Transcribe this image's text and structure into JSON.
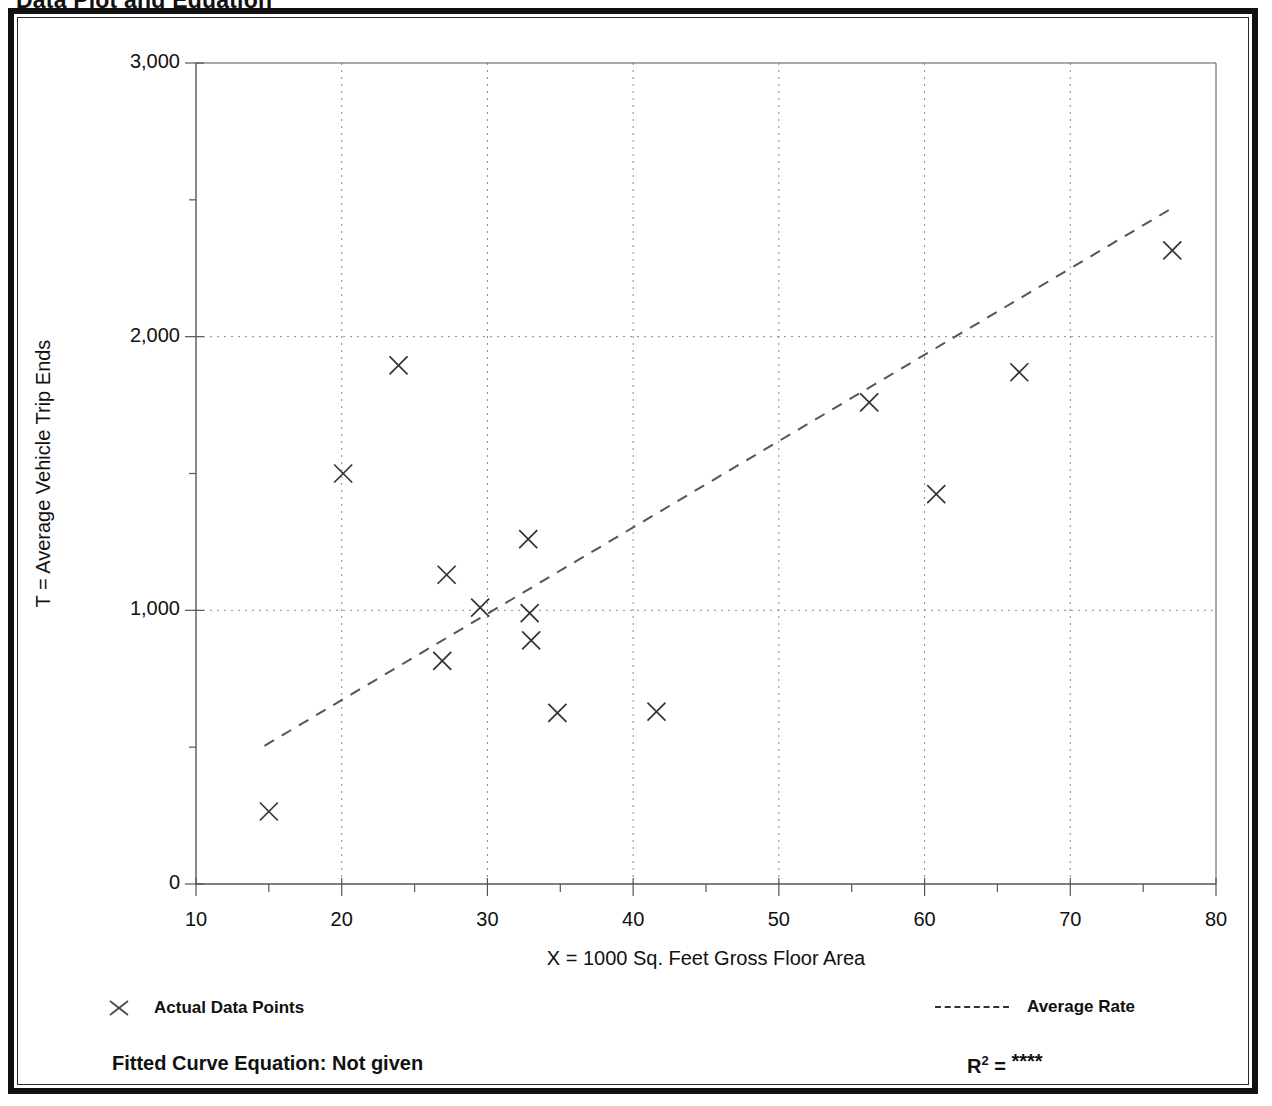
{
  "page": {
    "title": "Data Plot and Equation"
  },
  "chart_data": {
    "type": "scatter",
    "title": "Data Plot and Equation",
    "xlabel": "X = 1000 Sq. Feet Gross Floor Area",
    "ylabel": "T = Average Vehicle Trip Ends",
    "xlim": [
      10,
      80
    ],
    "ylim": [
      0,
      3000
    ],
    "xticks": [
      "10",
      "20",
      "30",
      "40",
      "50",
      "60",
      "70",
      "80"
    ],
    "xtick_values": [
      10,
      20,
      30,
      40,
      50,
      60,
      70,
      80
    ],
    "yticks": [
      "0",
      "1,000",
      "2,000",
      "3,000"
    ],
    "ytick_values": [
      0,
      1000,
      2000,
      3000
    ],
    "xminor_step": 5,
    "yminor_step": 500,
    "grid": "dotted at major ticks",
    "legend_position": "below plot, left and right",
    "series": [
      {
        "name": "Actual Data Points",
        "type": "scatter",
        "marker": "x",
        "points": [
          {
            "x": 15.0,
            "y": 265
          },
          {
            "x": 20.1,
            "y": 1500
          },
          {
            "x": 23.9,
            "y": 1895
          },
          {
            "x": 26.9,
            "y": 815
          },
          {
            "x": 27.2,
            "y": 1130
          },
          {
            "x": 29.5,
            "y": 1010
          },
          {
            "x": 32.8,
            "y": 1260
          },
          {
            "x": 32.9,
            "y": 990
          },
          {
            "x": 33.0,
            "y": 890
          },
          {
            "x": 34.8,
            "y": 625
          },
          {
            "x": 41.6,
            "y": 630
          },
          {
            "x": 56.2,
            "y": 1760
          },
          {
            "x": 60.8,
            "y": 1425
          },
          {
            "x": 66.5,
            "y": 1870
          },
          {
            "x": 77.0,
            "y": 2315
          }
        ]
      },
      {
        "name": "Average Rate",
        "type": "line",
        "style": "dashed",
        "endpoints": [
          {
            "x": 14.7,
            "y": 505
          },
          {
            "x": 77.0,
            "y": 2470
          }
        ]
      }
    ]
  },
  "legend": {
    "actual_data_points": "Actual Data Points",
    "average_rate": "Average Rate",
    "marker_icon": "x-marker-icon",
    "line_icon": "dashed-line-icon"
  },
  "footer": {
    "equation_label": "Fitted Curve Equation:  Not given",
    "r_symbol": "R",
    "r_exponent": "2",
    "r_equals": " = ",
    "r_value": "****"
  },
  "colors": {
    "frame": "#111111",
    "axis": "#555555",
    "grid": "#888888",
    "marker": "#333333",
    "trend": "#555555"
  }
}
